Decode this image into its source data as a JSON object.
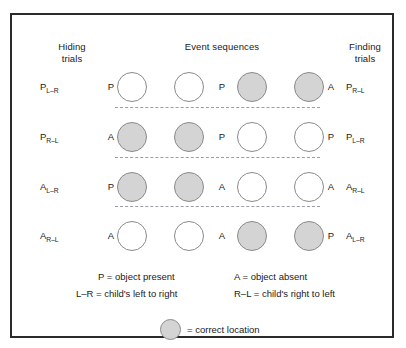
{
  "headers": {
    "hiding": "Hiding\ntrials",
    "event": "Event sequences",
    "finding": "Finding\ntrials"
  },
  "rows": [
    {
      "left_code_main": "P",
      "left_code_sub": "L–R",
      "left_pa": "P",
      "circles": [
        "white",
        "white",
        "gray",
        "gray"
      ],
      "mid_label": "P",
      "right_pa": "A",
      "right_code_main": "P",
      "right_code_sub": "R–L"
    },
    {
      "left_code_main": "P",
      "left_code_sub": "R–L",
      "left_pa": "A",
      "circles": [
        "gray",
        "gray",
        "white",
        "white"
      ],
      "mid_label": "P",
      "right_pa": "P",
      "right_code_main": "P",
      "right_code_sub": "L–R"
    },
    {
      "left_code_main": "A",
      "left_code_sub": "L–R",
      "left_pa": "P",
      "circles": [
        "gray",
        "gray",
        "white",
        "white"
      ],
      "mid_label": "A",
      "right_pa": "A",
      "right_code_main": "A",
      "right_code_sub": "R–L"
    },
    {
      "left_code_main": "A",
      "left_code_sub": "R–L",
      "left_pa": "A",
      "circles": [
        "white",
        "white",
        "gray",
        "gray"
      ],
      "mid_label": "A",
      "right_pa": "P",
      "right_code_main": "A",
      "right_code_sub": "L–R"
    }
  ],
  "legend": {
    "line1_left": "P = object present",
    "line1_right": "A = object absent",
    "line2_left": "L–R = child's left to right",
    "line2_right": "R–L = child's right to left",
    "key_text": "= correct location"
  },
  "colors": {
    "frame": "#2b2b2b",
    "circle_gray_fill": "#d4d4d4",
    "circle_border": "#8a8a8a",
    "separator": "#9a9aa8",
    "text": "#1a1a1a",
    "background": "#ffffff"
  }
}
